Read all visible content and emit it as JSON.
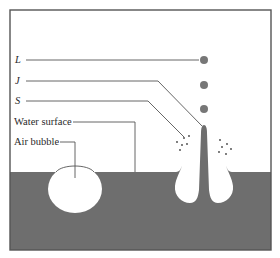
{
  "diagram": {
    "title": "",
    "labels": {
      "L": "L",
      "J": "J",
      "S": "S",
      "water_surface": "Water surface",
      "air_bubble": "Air bubble"
    },
    "colors": {
      "water": "#6e6e6e",
      "droplet": "#777777",
      "frame": "#555555",
      "leader_line": "#555555",
      "text": "#2a2a2a",
      "background": "#ffffff"
    },
    "droplets": [
      {
        "name": "L",
        "cx": 204,
        "cy": 60,
        "r": 4
      },
      {
        "name": "J",
        "cx": 204,
        "cy": 85,
        "r": 4
      },
      {
        "name": "S",
        "cx": 204,
        "cy": 109,
        "r": 4
      }
    ],
    "water_level_y": 172,
    "air_bubble": {
      "cx": 75,
      "cy": 189,
      "rx": 27,
      "ry": 24
    }
  }
}
